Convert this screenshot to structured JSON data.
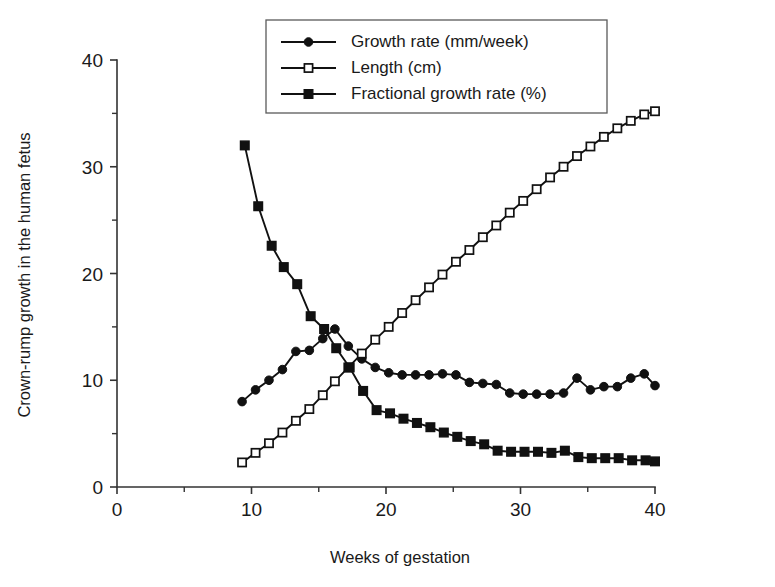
{
  "chart_data": {
    "type": "line",
    "title": "",
    "xlabel": "Weeks of gestation",
    "ylabel": "Crown-rump growth in the human fetus",
    "xlim": [
      0,
      40
    ],
    "ylim": [
      0,
      40
    ],
    "xticks": [
      0,
      10,
      20,
      30,
      40
    ],
    "yticks": [
      0,
      10,
      20,
      30,
      40
    ],
    "xminor_step": 5,
    "yminor_step": 5,
    "grid": false,
    "legend_position": "top-center",
    "series": [
      {
        "name": "Growth rate (mm/week)",
        "marker": "filled-circle",
        "x": [
          9.3,
          10.3,
          11.3,
          12.3,
          13.3,
          14.3,
          15.3,
          16.2,
          17.2,
          18.2,
          19.2,
          20.2,
          21.2,
          22.2,
          23.2,
          24.2,
          25.2,
          26.2,
          27.2,
          28.2,
          29.2,
          30.2,
          31.2,
          32.2,
          33.2,
          34.2,
          35.2,
          36.2,
          37.2,
          38.2,
          39.2,
          40.0
        ],
        "values": [
          8.0,
          9.1,
          10.0,
          11.0,
          12.7,
          12.8,
          13.9,
          14.8,
          13.2,
          12.0,
          11.2,
          10.7,
          10.5,
          10.5,
          10.5,
          10.6,
          10.5,
          9.8,
          9.7,
          9.6,
          8.8,
          8.7,
          8.7,
          8.7,
          8.8,
          10.2,
          9.1,
          9.4,
          9.4,
          10.2,
          10.6,
          9.5
        ]
      },
      {
        "name": "Length (cm)",
        "marker": "open-square",
        "x": [
          9.3,
          10.3,
          11.3,
          12.3,
          13.3,
          14.3,
          15.3,
          16.2,
          17.2,
          18.2,
          19.2,
          20.2,
          21.2,
          22.2,
          23.2,
          24.2,
          25.2,
          26.2,
          27.2,
          28.2,
          29.2,
          30.2,
          31.2,
          32.2,
          33.2,
          34.2,
          35.2,
          36.2,
          37.2,
          38.2,
          39.2,
          40.0
        ],
        "values": [
          2.3,
          3.2,
          4.1,
          5.1,
          6.2,
          7.3,
          8.6,
          9.9,
          11.2,
          12.5,
          13.8,
          15.0,
          16.3,
          17.5,
          18.7,
          19.9,
          21.1,
          22.2,
          23.4,
          24.5,
          25.7,
          26.8,
          27.9,
          29.0,
          30.0,
          31.0,
          31.9,
          32.8,
          33.6,
          34.3,
          34.9,
          35.2
        ]
      },
      {
        "name": "Fractional growth rate (%)",
        "marker": "filled-square",
        "x": [
          9.5,
          10.5,
          11.5,
          12.4,
          13.4,
          14.4,
          15.4,
          16.3,
          17.3,
          18.3,
          19.3,
          20.3,
          21.3,
          22.3,
          23.3,
          24.3,
          25.3,
          26.3,
          27.3,
          28.3,
          29.3,
          30.3,
          31.3,
          32.3,
          33.3,
          34.3,
          35.3,
          36.3,
          37.3,
          38.3,
          39.3,
          40.0
        ],
        "values": [
          32.0,
          26.3,
          22.6,
          20.6,
          19.0,
          16.0,
          14.8,
          13.0,
          11.2,
          9.0,
          7.2,
          6.9,
          6.4,
          6.0,
          5.6,
          5.1,
          4.7,
          4.3,
          4.0,
          3.4,
          3.3,
          3.3,
          3.3,
          3.2,
          3.4,
          2.8,
          2.7,
          2.7,
          2.7,
          2.5,
          2.5,
          2.4
        ]
      }
    ]
  },
  "legend": {
    "items": [
      {
        "label": "Growth rate (mm/week)",
        "marker": "filled-circle"
      },
      {
        "label": "Length (cm)",
        "marker": "open-square"
      },
      {
        "label": "Fractional growth rate (%)",
        "marker": "filled-square"
      }
    ]
  },
  "colors": {
    "ink": "#111111",
    "axis": "#333333",
    "background": "#ffffff",
    "legend_border": "#5a5a5a"
  }
}
